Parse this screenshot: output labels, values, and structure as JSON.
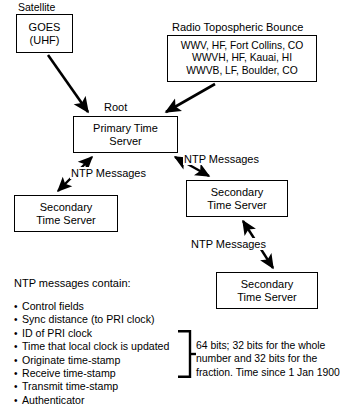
{
  "diagram": {
    "title_captions": {
      "satellite": "Satellite",
      "radio": "Radio Topospheric Bounce",
      "root": "Root"
    },
    "nodes": {
      "goes": {
        "line1": "GOES",
        "line2": "(UHF)"
      },
      "radio_sources": {
        "line1": "WWV, HF, Fort Collins, CO",
        "line2": "WWVH, HF, Kauai, HI",
        "line3": "WWVB, LF, Boulder, CO"
      },
      "primary": {
        "line1": "Primary Time",
        "line2": "Server"
      },
      "secondary_left": {
        "line1": "Secondary",
        "line2": "Time Server"
      },
      "secondary_mid": {
        "line1": "Secondary",
        "line2": "Time Server"
      },
      "secondary_bottom": {
        "line1": "Secondary",
        "line2": "Time Server"
      }
    },
    "edge_labels": {
      "primary_to_secondary_left": "NTP Messages",
      "primary_to_secondary_mid": "NTP Messages",
      "secondary_mid_to_secondary_bottom": "NTP Messages"
    }
  },
  "legend": {
    "title": "NTP messages contain:",
    "items": [
      "Control fields",
      "Sync distance (to PRI clock)",
      "ID of PRI clock",
      "Time that local clock is updated",
      "Originate time-stamp",
      "Receive time-stamp",
      "Transmit time-stamp",
      "Authenticator"
    ],
    "note": "64 bits; 32 bits for the whole number and 32 bits for the fraction.  Time since 1 Jan 1900"
  },
  "colors": {
    "stroke": "#000000",
    "background": "#ffffff"
  }
}
